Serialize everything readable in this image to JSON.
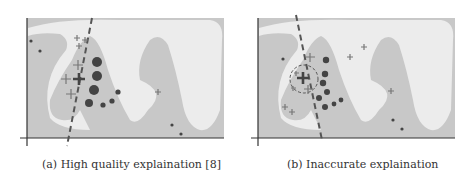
{
  "figure": {
    "colors": {
      "region_dark": "#c8c8c8",
      "region_light": "#ececec",
      "axis": "#333333",
      "marker": "#444444",
      "plus": "#777777",
      "boundary": "#555555"
    },
    "panels": [
      {
        "id": "a",
        "caption": "(a)  High quality explaination [8]",
        "description": "Explanation line (dashed) correctly separates local plus markers from circle markers near the instance"
      },
      {
        "id": "b",
        "caption": "(b) Inaccurate explaination",
        "description": "Explanation line (dashed) with a dashed circle around the instance, misaligned with the decision boundary"
      }
    ]
  }
}
